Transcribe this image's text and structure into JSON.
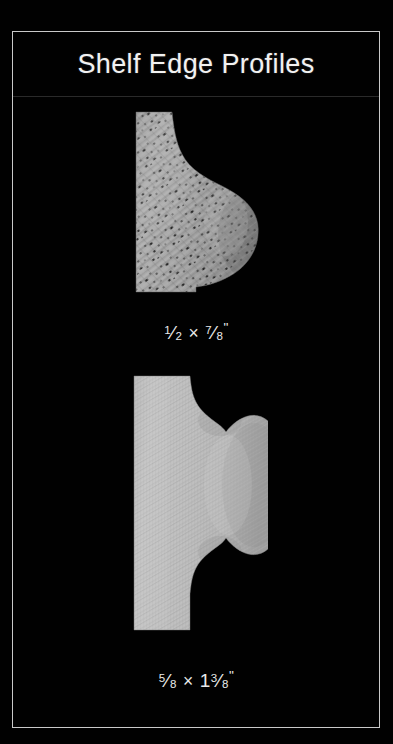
{
  "poster": {
    "background_color": "#010101",
    "frame_color": "#c9c9c9",
    "title": "Shelf Edge Profiles",
    "title_color": "#f2f2f2",
    "divider_color": "#2a2a2a"
  },
  "profiles": [
    {
      "name": "small-ogee-bullnose-profile",
      "caption": "½ × ⅞\"",
      "caption_parts": {
        "width_numerator": "1",
        "width_denominator": "2",
        "separator": "×",
        "height_numerator": "7",
        "height_denominator": "8",
        "unit": "\""
      },
      "material": "speckled open-grain wood (oak-like)",
      "base_color": "#a3a3a3",
      "shadow_color": "#6e6e6e",
      "speckle_color": "#1b1b1b"
    },
    {
      "name": "large-double-ogee-bullnose-profile",
      "caption": "⅝ × 1⅜\"",
      "caption_parts": {
        "width_numerator": "5",
        "width_denominator": "8",
        "separator": "×",
        "height_whole": "1",
        "height_numerator": "3",
        "height_denominator": "8",
        "unit": "\""
      },
      "material": "fine straight-grain wood (maple/poplar-like)",
      "base_color": "#bdbdbd",
      "shadow_color": "#8f8f8f",
      "grain_color": "#a8a8a8"
    }
  ]
}
